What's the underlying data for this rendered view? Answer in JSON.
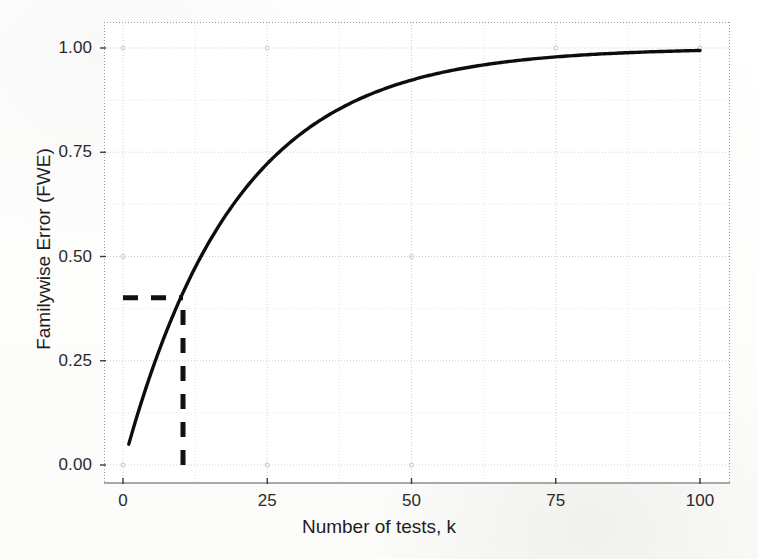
{
  "chart_data": {
    "type": "line",
    "title": "",
    "xlabel": "Number of tests, k",
    "ylabel": "Familywise Error (FWE)",
    "xlim": [
      0,
      100
    ],
    "ylim": [
      0.0,
      1.0
    ],
    "grid": true,
    "legend": "none",
    "alpha": 0.05,
    "formula": "FWE = 1 - (1 - 0.05)^k",
    "xticks": [
      "0",
      "25",
      "50",
      "75",
      "100"
    ],
    "xtick_values": [
      0,
      25,
      50,
      75,
      100
    ],
    "yticks": [
      "0.00",
      "0.25",
      "0.50",
      "0.75",
      "1.00"
    ],
    "ytick_values": [
      0.0,
      0.25,
      0.5,
      0.75,
      1.0
    ],
    "series": [
      {
        "name": "Familywise error rate",
        "style": "solid",
        "color": "#111111",
        "x": [
          1,
          2,
          3,
          4,
          5,
          6,
          7,
          8,
          9,
          10,
          12,
          14,
          16,
          18,
          20,
          25,
          30,
          35,
          40,
          45,
          50,
          55,
          60,
          65,
          70,
          75,
          80,
          85,
          90,
          95,
          100
        ],
        "y": [
          0.05,
          0.098,
          0.143,
          0.185,
          0.226,
          0.265,
          0.302,
          0.337,
          0.37,
          0.401,
          0.46,
          0.512,
          0.56,
          0.603,
          0.642,
          0.723,
          0.785,
          0.834,
          0.871,
          0.901,
          0.923,
          0.94,
          0.954,
          0.965,
          0.973,
          0.979,
          0.983,
          0.987,
          0.99,
          0.992,
          0.994
        ]
      }
    ],
    "annotations": [
      {
        "name": "fwe-reference-horizontal",
        "type": "hline-segment",
        "style": "dashed",
        "color": "#111111",
        "y": 0.401,
        "x_start": 0,
        "x_end": 10.4
      },
      {
        "name": "k-reference-vertical",
        "type": "vline-segment",
        "style": "dashed",
        "color": "#111111",
        "x": 10.4,
        "y_start": 0.0,
        "y_end": 0.401
      }
    ],
    "reference_point": {
      "k": 10,
      "fwe": 0.4
    }
  },
  "axes": {
    "y_ticks": [
      {
        "label": "1.00",
        "value": 1.0
      },
      {
        "label": "0.75",
        "value": 0.75
      },
      {
        "label": "0.50",
        "value": 0.5
      },
      {
        "label": "0.25",
        "value": 0.25
      },
      {
        "label": "0.00",
        "value": 0.0
      }
    ],
    "x_ticks": [
      {
        "label": "0",
        "value": 0
      },
      {
        "label": "25",
        "value": 25
      },
      {
        "label": "50",
        "value": 50
      },
      {
        "label": "75",
        "value": 75
      },
      {
        "label": "100",
        "value": 100
      }
    ],
    "x_title": "Number of tests, k",
    "y_title": "Familywise Error (FWE)"
  },
  "style": {
    "curve_color": "#111111",
    "annotation_color": "#111111",
    "major_grid_color": "#cfcfcf",
    "minor_grid_color": "#e4e4e4",
    "axis_line_color": "#8d8d8d",
    "panel_background": "#ffffff",
    "page_background": "#fdfdfc",
    "tick_label_color": "#2a2a2a"
  }
}
